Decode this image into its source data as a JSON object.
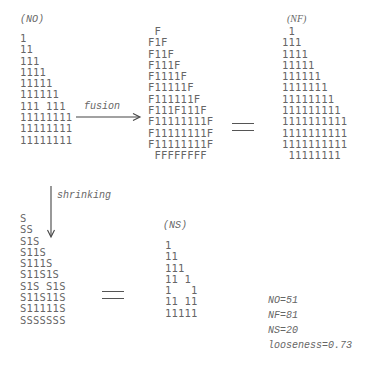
{
  "no_grid": {
    "label": "(NO)",
    "rows": [
      "1",
      "11",
      "111",
      "1111",
      "11111",
      "111111",
      "111 111",
      "11111111",
      "11111111",
      "11111111"
    ]
  },
  "fusion": {
    "label": "fusion"
  },
  "f_grid": {
    "rows": [
      " F",
      "F1F",
      "F11F",
      "F111F",
      "F1111F",
      "F11111F",
      "F111111F",
      "F111F111F",
      "F11111111F",
      "F11111111F",
      "F11111111F",
      " FFFFFFFF"
    ]
  },
  "nf_grid": {
    "label": "(NF)",
    "rows": [
      " 1",
      "111",
      "1111",
      "11111",
      "111111",
      "1111111",
      "11111111",
      "111111111",
      "1111111111",
      "1111111111",
      "1111111111",
      " 11111111"
    ]
  },
  "shrinking": {
    "label": "shrinking"
  },
  "s_grid": {
    "rows": [
      "S",
      "SS",
      "S1S",
      "S11S",
      "S111S",
      "S11S1S",
      "S1S S1S",
      "S11S11S",
      "S11111S",
      "SSSSSSS"
    ]
  },
  "ns_grid": {
    "label": "(NS)",
    "rows": [
      "1",
      "11",
      "111",
      "11 1",
      "1   1",
      "11 11",
      "11111"
    ]
  },
  "stats": {
    "no": "NO=51",
    "nf": "NF=81",
    "ns": "NS=20",
    "looseness": "looseness=0.73"
  }
}
